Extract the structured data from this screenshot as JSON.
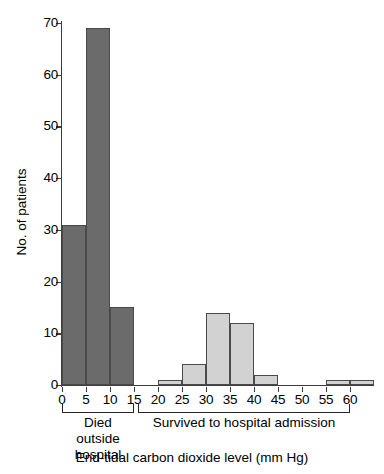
{
  "chart_data": {
    "type": "bar",
    "title": "",
    "subtitle": "",
    "xlabel": "End-tidal carbon dioxide level (mm Hg)",
    "ylabel": "No. of patients",
    "categories": [
      "0",
      "5",
      "10",
      "15",
      "20",
      "25",
      "30",
      "35",
      "40",
      "45",
      "50",
      "55",
      "60"
    ],
    "values": [
      31,
      69,
      15,
      0,
      1,
      4,
      14,
      12,
      2,
      0,
      0,
      1,
      1
    ],
    "bar_colors": [
      "#6b6b6b",
      "#6b6b6b",
      "#6b6b6b",
      "#6b6b6b",
      "#d2d2d2",
      "#d2d2d2",
      "#d2d2d2",
      "#d2d2d2",
      "#d2d2d2",
      "#d2d2d2",
      "#d2d2d2",
      "#d2d2d2",
      "#d2d2d2"
    ],
    "xlim": [
      0,
      65
    ],
    "ylim": [
      0,
      70
    ],
    "yticks": [
      0,
      10,
      20,
      30,
      40,
      50,
      60,
      70
    ],
    "xticks": [
      0,
      5,
      10,
      15,
      20,
      25,
      30,
      35,
      40,
      45,
      50,
      55,
      60
    ],
    "grid": false,
    "legend_position": "none",
    "bin_width": 5,
    "groups": [
      {
        "label": "Died outside\nhospital",
        "range": [
          0,
          15
        ],
        "color": "#6b6b6b"
      },
      {
        "label": "Survived to hospital admission",
        "range": [
          15,
          60
        ],
        "color": "#d2d2d2"
      }
    ],
    "annotations": []
  },
  "colors": {
    "axis": "#3d3d3d",
    "bar_outline": "#4a4a4a",
    "dark_bar": "#6b6b6b",
    "light_bar": "#d2d2d2",
    "text": "#000000",
    "background": "#ffffff"
  }
}
